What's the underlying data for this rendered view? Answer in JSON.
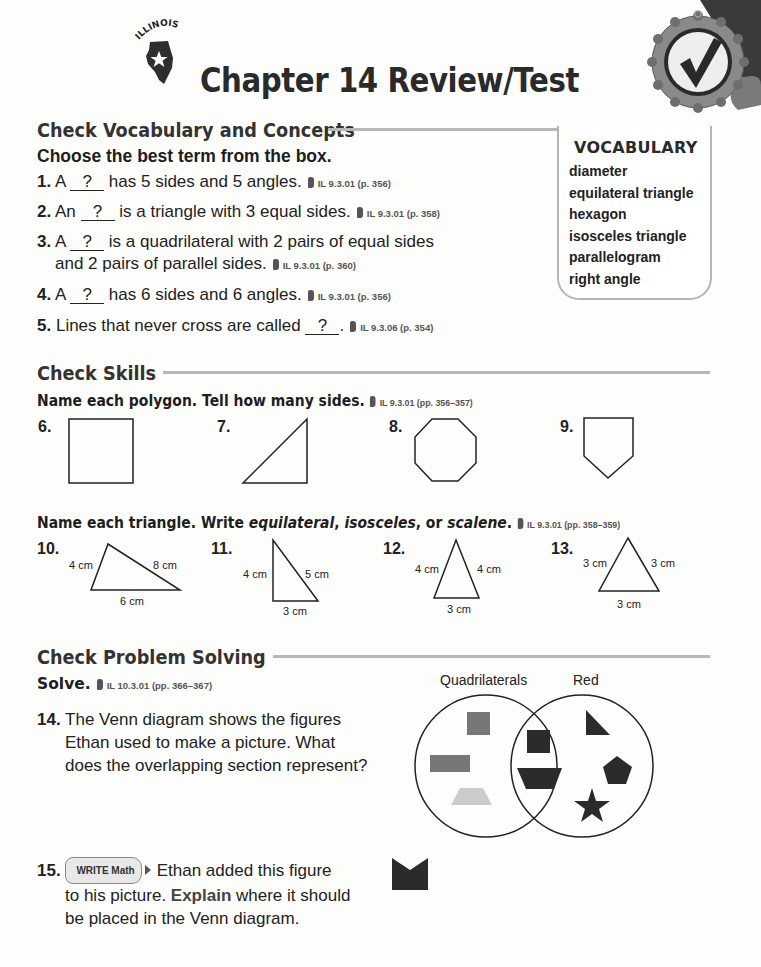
{
  "header": {
    "state_label": "ILLINOIS",
    "title": "Chapter 14 Review/Test"
  },
  "vocab_section": {
    "title": "Check Vocabulary and Concepts",
    "instruction": "Choose the best term from the box.",
    "questions": [
      {
        "num": "1.",
        "pre": "A ",
        "blank": "?",
        "post": " has 5 sides and 5 angles.",
        "std": "IL 9.3.01 (p. 356)"
      },
      {
        "num": "2.",
        "pre": "An ",
        "blank": "?",
        "post": " is a triangle with 3 equal sides.",
        "std": "IL 9.3.01 (p. 358)"
      },
      {
        "num": "3.",
        "pre": "A ",
        "blank": "?",
        "post": " is a quadrilateral with 2 pairs of equal sides",
        "line2": "and 2 pairs of parallel sides.",
        "std": "IL 9.3.01 (p. 360)"
      },
      {
        "num": "4.",
        "pre": "A ",
        "blank": "?",
        "post": " has 6 sides and 6 angles.",
        "std": "IL 9.3.01 (p. 356)"
      },
      {
        "num": "5.",
        "pre": "Lines that never cross are called ",
        "blank": "?",
        "post": ".",
        "std": "IL 9.3.06 (p. 354)"
      }
    ],
    "vocab_box": {
      "title": "VOCABULARY",
      "terms": [
        "diameter",
        "equilateral triangle",
        "hexagon",
        "isosceles triangle",
        "parallelogram",
        "right angle"
      ]
    }
  },
  "skills_section": {
    "title": "Check Skills",
    "polygon_instruction": "Name each polygon. Tell how many sides.",
    "polygon_std": "IL 9.3.01 (pp. 356–357)",
    "polygons": [
      {
        "num": "6.",
        "shape": "rectangle"
      },
      {
        "num": "7.",
        "shape": "right-triangle"
      },
      {
        "num": "8.",
        "shape": "octagon"
      },
      {
        "num": "9.",
        "shape": "pentagon"
      }
    ],
    "triangle_instruction_pre": "Name each triangle. Write ",
    "triangle_terms": [
      "equilateral",
      "isosceles",
      "scalene"
    ],
    "triangle_sep1": ", ",
    "triangle_sep2": ", or ",
    "triangle_end": ".",
    "triangle_std": "IL 9.3.01 (pp. 358–359)",
    "triangles": [
      {
        "num": "10.",
        "left": "4 cm",
        "right": "8 cm",
        "bottom": "6 cm"
      },
      {
        "num": "11.",
        "left": "4 cm",
        "right": "5 cm",
        "bottom": "3 cm"
      },
      {
        "num": "12.",
        "left": "4 cm",
        "right": "4 cm",
        "bottom": "3 cm"
      },
      {
        "num": "13.",
        "left": "3 cm",
        "right": "3 cm",
        "bottom": "3 cm"
      }
    ]
  },
  "problem_section": {
    "title": "Check Problem Solving",
    "instruction": "Solve.",
    "std": "IL 10.3.01 (pp. 366–367)",
    "q14": {
      "num": "14.",
      "lines": [
        "The Venn diagram shows the figures",
        "Ethan used to make a picture. What",
        "does the overlapping section represent?"
      ]
    },
    "venn": {
      "left_label": "Quadrilaterals",
      "right_label": "Red",
      "colors": {
        "red_dark": "#2b2b2b",
        "other_gray": "#777777",
        "light": "#cccccc"
      }
    },
    "q15": {
      "num": "15.",
      "badge": "WRITE Math",
      "line1": "Ethan added this figure",
      "line2_pre": "to his picture. ",
      "line2_bold": "Explain",
      "line2_post": " where it should",
      "line3": "be placed in the Venn diagram."
    }
  }
}
